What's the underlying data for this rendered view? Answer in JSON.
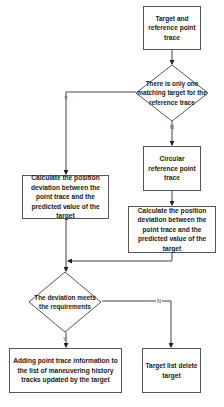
{
  "flowchart": {
    "nodes": {
      "start": {
        "type": "process",
        "label": "Target and reference point trace"
      },
      "decision1": {
        "type": "decision",
        "label": "There is only one matching target for the reference trace"
      },
      "calc_left": {
        "type": "process",
        "label": "Calculate the position deviation between the point trace and the predicted value of the target"
      },
      "circular": {
        "type": "process",
        "label": "Circular reference point trace"
      },
      "calc_right": {
        "type": "process",
        "label": "Calculate the position deviation between the point trace and the predicted value of the target"
      },
      "decision2": {
        "type": "decision",
        "label": "The deviation meets the requirements"
      },
      "add_info": {
        "type": "process",
        "label": "Adding point trace information to the list of maneuvering history tracks updated by the target"
      },
      "delete": {
        "type": "process",
        "label": "Target list delete target"
      }
    },
    "edges": [
      {
        "from": "start",
        "to": "decision1",
        "label": ""
      },
      {
        "from": "decision1",
        "to": "calc_left",
        "label": "Y"
      },
      {
        "from": "decision1",
        "to": "circular",
        "label": "N"
      },
      {
        "from": "circular",
        "to": "calc_right",
        "label": ""
      },
      {
        "from": "calc_left",
        "to": "decision2",
        "label": ""
      },
      {
        "from": "calc_right",
        "to": "decision2",
        "label": ""
      },
      {
        "from": "decision2",
        "to": "add_info",
        "label": "Y"
      },
      {
        "from": "decision2",
        "to": "delete",
        "label": "N"
      }
    ]
  }
}
